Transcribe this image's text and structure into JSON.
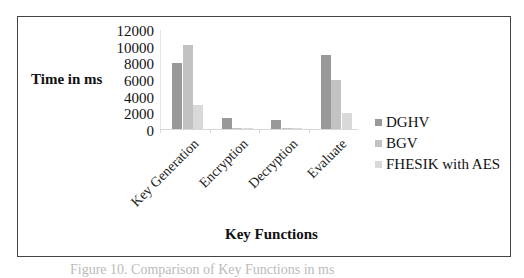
{
  "chart_data": {
    "type": "bar",
    "title": "",
    "xlabel": "Key Functions",
    "ylabel": "Time in ms",
    "categories": [
      "Key Generation",
      "Encryption",
      "Decryption",
      "Evaluate"
    ],
    "series": [
      {
        "name": "DGHV",
        "color": "#999999",
        "values": [
          8000,
          1300,
          1100,
          9000
        ]
      },
      {
        "name": "BGV",
        "color": "#c2c2c2",
        "values": [
          10200,
          100,
          80,
          6000
        ]
      },
      {
        "name": "FHESIK with AES",
        "color": "#d9d9d9",
        "values": [
          2950,
          50,
          30,
          1900
        ]
      }
    ],
    "ylim": [
      0,
      12000
    ],
    "yticks": [
      "12000",
      "10000",
      "8000",
      "6000",
      "4000",
      "2000",
      "0"
    ],
    "grid": false,
    "legend_position": "right"
  },
  "caption": "Figure 10. Comparison of Key Functions in ms"
}
